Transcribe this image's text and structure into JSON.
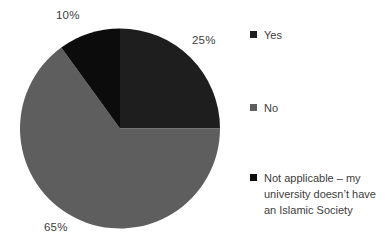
{
  "chart_data": {
    "type": "pie",
    "title": "",
    "categories": [
      "Yes",
      "No",
      "Not applicable – my university doesn’t have an Islamic Society"
    ],
    "values": [
      25,
      65,
      10
    ],
    "unit": "percent",
    "slice_labels": [
      "25%",
      "65%",
      "10%"
    ],
    "colors": [
      "#1e1e1e",
      "#5e5e5e",
      "#0c0c0c"
    ],
    "slice_names": [
      "yes",
      "no",
      "not-applicable"
    ],
    "start_angle_deg": 0,
    "direction": "clockwise",
    "legend_position": "right",
    "label_position": "outside",
    "geometry": {
      "cx": 120,
      "cy": 128.5,
      "r": 100
    },
    "text_color": "#3d3d3d",
    "background_color": "#ffffff"
  }
}
